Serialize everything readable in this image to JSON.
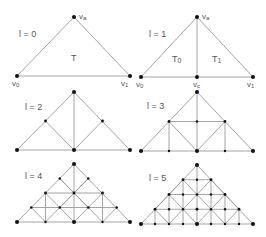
{
  "figure": {
    "panels": [
      {
        "level_label": "l = 0",
        "triangle_labels": [
          "T"
        ],
        "vertex_labels": {
          "apex": "va",
          "left": "v0",
          "right": "v1"
        }
      },
      {
        "level_label": "l = 1",
        "triangle_labels": [
          "T0",
          "T1"
        ],
        "vertex_labels": {
          "apex": "va",
          "left": "v0",
          "right": "v1",
          "mid": "vc"
        }
      },
      {
        "level_label": "l = 2"
      },
      {
        "level_label": "l = 3"
      },
      {
        "level_label": "l = 4"
      },
      {
        "level_label": "l = 5"
      }
    ],
    "colors": {
      "edge": "#9a9a9a",
      "vertex": "#111111",
      "text": "#555555"
    }
  }
}
